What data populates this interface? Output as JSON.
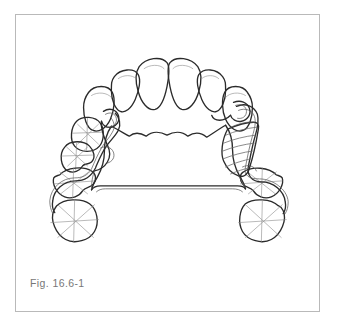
{
  "figure": {
    "caption": "Fig. 16.6-1",
    "frame_border_color": "#b9b9b9",
    "background_color": "#ffffff",
    "ink_color": "#2b2b2b",
    "caption_color": "#777777"
  },
  "diagram": {
    "type": "dental-arch-line-drawing",
    "view": "maxillary-occlusal",
    "components": [
      {
        "name": "central-incisor-right",
        "label": ""
      },
      {
        "name": "central-incisor-left",
        "label": ""
      },
      {
        "name": "lateral-incisor-right",
        "label": ""
      },
      {
        "name": "lateral-incisor-left",
        "label": ""
      },
      {
        "name": "canine-right",
        "label": ""
      },
      {
        "name": "canine-left",
        "label": ""
      },
      {
        "name": "premolar-first-left",
        "label": ""
      },
      {
        "name": "premolar-second-left",
        "label": ""
      },
      {
        "name": "molar-first-left",
        "label": ""
      },
      {
        "name": "molar-second-left",
        "label": ""
      },
      {
        "name": "molar-first-right",
        "label": ""
      },
      {
        "name": "molar-second-right",
        "label": ""
      },
      {
        "name": "palatal-major-connector",
        "label": ""
      },
      {
        "name": "retention-mesh-saddle",
        "label": ""
      },
      {
        "name": "clasp-arm-left",
        "label": ""
      },
      {
        "name": "clasp-arm-right",
        "label": ""
      },
      {
        "name": "occlusal-rest-left",
        "label": ""
      },
      {
        "name": "occlusal-rest-right",
        "label": ""
      }
    ]
  }
}
